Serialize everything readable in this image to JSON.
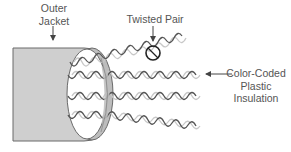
{
  "diagram": {
    "labels": {
      "outer_jacket": [
        "Outer",
        "Jacket"
      ],
      "twisted_pair": "Twisted Pair",
      "insulation": [
        "Color-Coded",
        "Plastic",
        "Insulation"
      ]
    },
    "components": [
      {
        "name": "outer-jacket",
        "label": "Outer Jacket"
      },
      {
        "name": "twisted-pair",
        "label": "Twisted Pair",
        "count": 4
      },
      {
        "name": "insulation",
        "label": "Color-Coded Plastic Insulation"
      }
    ],
    "colors": {
      "jacket_fill": "#cfcfcf",
      "jacket_band": "#bdbdbd",
      "outline": "#6a6a6a",
      "wire_dark": "#555555",
      "wire_light": "#c8c8c8",
      "highlight_circle": "#222222",
      "text": "#555555",
      "arrow": "#444444"
    }
  }
}
